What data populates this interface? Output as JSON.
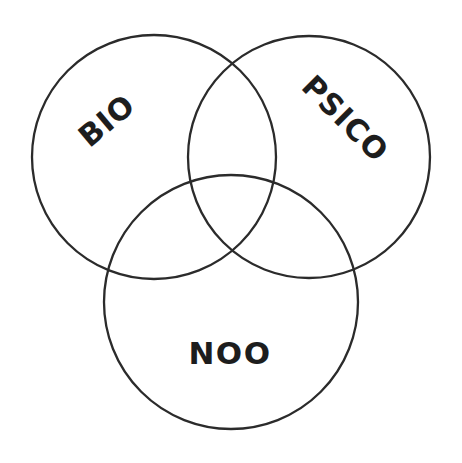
{
  "diagram": {
    "type": "venn",
    "title": "",
    "background_color": "#ffffff",
    "stroke_color": "#2b2b2b",
    "stroke_width": 2.3,
    "text_color": "#1d1d1d",
    "canvas": {
      "width": 462,
      "height": 463
    },
    "sets": [
      {
        "id": "bio",
        "label": "BIO",
        "cx": 154,
        "cy": 157,
        "r": 122,
        "label_x": 108,
        "label_y": 122,
        "label_rotation": -40,
        "font_size": 30
      },
      {
        "id": "psico",
        "label": "PSICO",
        "cx": 309,
        "cy": 157,
        "r": 121,
        "label_x": 344,
        "label_y": 120,
        "label_rotation": 45,
        "font_size": 30
      },
      {
        "id": "noo",
        "label": "NOO",
        "cx": 231,
        "cy": 302,
        "r": 127,
        "label_x": 230,
        "label_y": 355,
        "label_rotation": 0,
        "font_size": 31
      }
    ],
    "regions": [
      {
        "id": "bio-only",
        "label": ""
      },
      {
        "id": "psico-only",
        "label": ""
      },
      {
        "id": "noo-only",
        "label": ""
      },
      {
        "id": "bio-psico",
        "label": ""
      },
      {
        "id": "bio-noo",
        "label": ""
      },
      {
        "id": "psico-noo",
        "label": ""
      },
      {
        "id": "bio-psico-noo",
        "label": ""
      }
    ]
  }
}
